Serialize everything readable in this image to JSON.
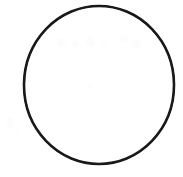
{
  "image": {
    "kind": "scanned-line-drawing",
    "subject": "circle-outline",
    "width_px": 183,
    "height_px": 177,
    "background_color": "#ffffff",
    "visible_text": "",
    "caption": ""
  },
  "shape": {
    "name": "circle",
    "stroke_color": "#1a1a1a",
    "fill_color": "#ffffff",
    "stroke_width_px": 2.6,
    "center_x_px": 99,
    "center_y_px": 85,
    "radius_x_px": 75,
    "radius_y_px": 79,
    "bounds": {
      "left_px": 24,
      "top_px": 6,
      "right_px": 174,
      "bottom_px": 164
    },
    "appearance_note": "hand-drawn ink outline, slightly uneven thickness"
  },
  "artifacts": {
    "note": "faint light-gray scanner smudges",
    "color": "#fafafa",
    "marks": [
      {
        "name": "smudge-top-1",
        "x_px": 58,
        "y_px": 38,
        "w_px": 7,
        "h_px": 9,
        "opacity": 0.55
      },
      {
        "name": "smudge-top-2",
        "x_px": 72,
        "y_px": 41,
        "w_px": 6,
        "h_px": 7,
        "opacity": 0.5
      },
      {
        "name": "smudge-top-3",
        "x_px": 86,
        "y_px": 37,
        "w_px": 8,
        "h_px": 10,
        "opacity": 0.6
      },
      {
        "name": "smudge-top-4",
        "x_px": 101,
        "y_px": 42,
        "w_px": 6,
        "h_px": 6,
        "opacity": 0.45
      },
      {
        "name": "smudge-top-5",
        "x_px": 118,
        "y_px": 36,
        "w_px": 10,
        "h_px": 7,
        "opacity": 0.55
      },
      {
        "name": "smudge-top-6",
        "x_px": 132,
        "y_px": 40,
        "w_px": 9,
        "h_px": 8,
        "opacity": 0.5
      },
      {
        "name": "smudge-center-1",
        "x_px": 88,
        "y_px": 84,
        "w_px": 4,
        "h_px": 5,
        "opacity": 0.4
      },
      {
        "name": "smudge-left-1",
        "x_px": 6,
        "y_px": 118,
        "w_px": 8,
        "h_px": 10,
        "opacity": 0.5
      },
      {
        "name": "smudge-left-2",
        "x_px": 14,
        "y_px": 132,
        "w_px": 5,
        "h_px": 6,
        "opacity": 0.4
      }
    ]
  }
}
